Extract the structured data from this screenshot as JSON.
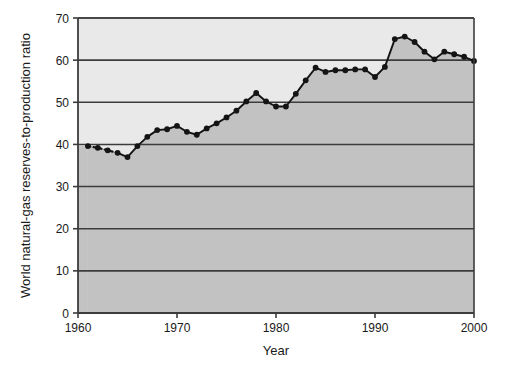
{
  "chart_data": {
    "type": "area",
    "title": "",
    "xlabel": "Year",
    "ylabel": "World natural-gas reserves-to-production ratio",
    "xlim": [
      1960,
      2000
    ],
    "ylim": [
      0,
      70
    ],
    "xticks": [
      1960,
      1970,
      1980,
      1990,
      2000
    ],
    "yticks": [
      0,
      10,
      20,
      30,
      40,
      50,
      60,
      70
    ],
    "grid": "horizontal",
    "legend": "none",
    "series": [
      {
        "name": "World natural-gas reserves-to-production ratio",
        "x": [
          1961,
          1962,
          1963,
          1964,
          1965,
          1966,
          1967,
          1968,
          1969,
          1970,
          1971,
          1972,
          1973,
          1974,
          1975,
          1976,
          1977,
          1978,
          1979,
          1980,
          1981,
          1982,
          1983,
          1984,
          1985,
          1986,
          1987,
          1988,
          1989,
          1990,
          1991,
          1992,
          1993,
          1994,
          1995,
          1996,
          1997,
          1998,
          1999,
          2000
        ],
        "values": [
          39.6,
          39.2,
          38.6,
          38.0,
          37.0,
          39.6,
          41.8,
          43.4,
          43.6,
          44.4,
          43.0,
          42.3,
          43.8,
          45.0,
          46.4,
          48.0,
          50.2,
          52.2,
          50.2,
          49.0,
          49.0,
          52.0,
          55.2,
          58.2,
          57.2,
          57.6,
          57.6,
          57.8,
          57.8,
          56.0,
          58.4,
          65.0,
          65.6,
          64.3,
          62.0,
          60.2,
          62.0,
          61.4,
          60.8,
          59.8
        ],
        "dotted_segment_years": [
          1961,
          1962,
          1963,
          1964
        ],
        "marker": "filled-circle",
        "line_color": "#141414",
        "fill_color": "#c2c2c2"
      }
    ],
    "plot_background_color": "#e9e9e9",
    "axis_color": "#3c3c3c",
    "watermark_text": ""
  }
}
